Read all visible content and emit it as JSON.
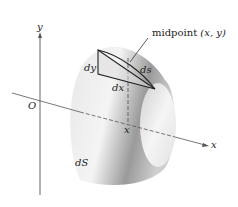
{
  "diagram": {
    "type": "surface-of-revolution",
    "labels": {
      "y_axis": "y",
      "x_axis": "x",
      "origin": "O",
      "x_tick": "x",
      "dy": "dy",
      "dx": "dx",
      "ds": "ds",
      "dS": "dS",
      "midpoint_word": "midpoint",
      "midpoint_coords": "(x, y)"
    },
    "colors": {
      "axis": "#555555",
      "outline": "#222222",
      "surface_light": "#f2f2f2",
      "surface_dark": "#8a8a8a"
    }
  }
}
